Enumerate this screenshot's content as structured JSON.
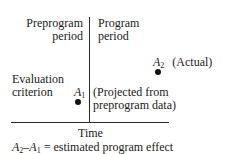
{
  "diagram": {
    "left_header": {
      "line1": "Preprogram",
      "line2": "period"
    },
    "right_header": {
      "line1": "Program",
      "line2": "period"
    },
    "y_label": {
      "line1": "Evaluation",
      "line2": "criterion"
    },
    "x_label": "Time",
    "point_a1": {
      "var": "A",
      "sub": "1",
      "note_line1": "(Projected from",
      "note_line2": "preprogram data)"
    },
    "point_a2": {
      "var": "A",
      "sub": "2",
      "note": "(Actual)"
    },
    "caption": {
      "a2": "A",
      "a2_sub": "2",
      "dash": "–",
      "a1": "A",
      "a1_sub": "1",
      "rest": " = estimated program effect"
    }
  }
}
